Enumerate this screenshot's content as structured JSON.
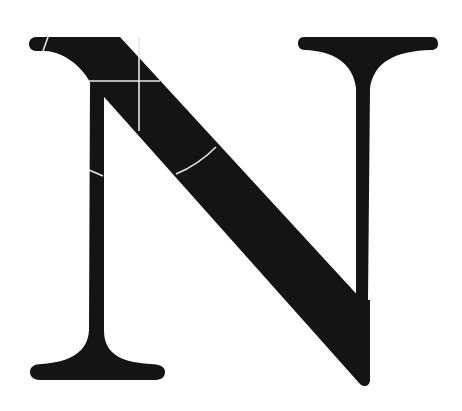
{
  "figure": {
    "letter": "N",
    "colors": {
      "background": "#ffffff",
      "glyph": "#141414",
      "construction_lines": "#e8e8e8"
    }
  }
}
